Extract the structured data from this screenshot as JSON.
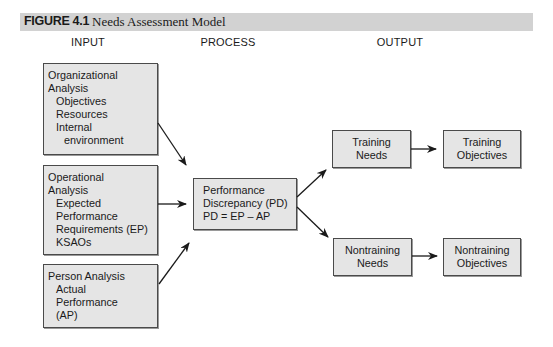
{
  "figure": {
    "number": "FIGURE 4.1",
    "title": "Needs Assessment Model"
  },
  "columns": {
    "input": "INPUT",
    "process": "PROCESS",
    "output": "OUTPUT"
  },
  "boxes": {
    "organizational": {
      "lines": [
        "Organizational",
        "Analysis",
        "Objectives",
        "Resources",
        "Internal",
        "environment"
      ]
    },
    "operational": {
      "lines": [
        "Operational",
        "Analysis",
        "Expected",
        "Performance",
        "Requirements (EP)",
        "KSAOs"
      ]
    },
    "person": {
      "lines": [
        "Person Analysis",
        "Actual",
        "Performance",
        "(AP)"
      ]
    },
    "discrepancy": {
      "lines": [
        "Performance",
        "Discrepancy (PD)",
        "PD = EP – AP"
      ]
    },
    "training_needs": {
      "lines": [
        "Training",
        "Needs"
      ]
    },
    "training_objectives": {
      "lines": [
        "Training",
        "Objectives"
      ]
    },
    "nontraining_needs": {
      "lines": [
        "Nontraining",
        "Needs"
      ]
    },
    "nontraining_objectives": {
      "lines": [
        "Nontraining",
        "Objectives"
      ]
    }
  },
  "colors": {
    "box_fill": "#e5e5e5",
    "box_border": "#4a4a4a",
    "header_bar": "#d2d2d2",
    "arrow": "#1a1a1a"
  }
}
